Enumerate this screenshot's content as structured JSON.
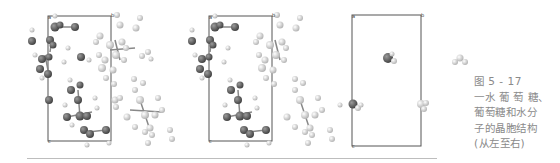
{
  "figure": {
    "panels": [
      {
        "name": "glucose-monohydrate-unit-cell",
        "corner_labels": [
          "a",
          "b",
          "c"
        ]
      },
      {
        "name": "glucose-unit-cell",
        "corner_labels": [
          "a",
          "b",
          "c"
        ]
      },
      {
        "name": "water-unit-cell",
        "corner_labels": [
          "a",
          "b",
          "c"
        ]
      }
    ],
    "colors": {
      "dark_atom": "#5a5a5a",
      "light_atom": "#dcdcdc",
      "cell_edge": "#555555"
    }
  },
  "caption": {
    "number": "图 5 - 17",
    "line1": "一水 葡 萄 糖、",
    "line2": "葡萄糖和水分",
    "line3": "子的晶胞结构",
    "line4": "(从左至右)"
  }
}
